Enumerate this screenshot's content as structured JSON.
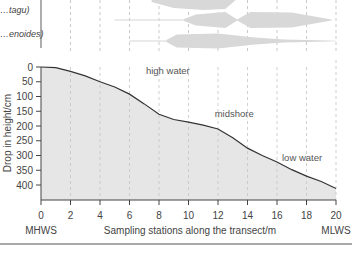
{
  "chart_data": {
    "type": "area",
    "title": "",
    "xlabel": "Sampling stations along the transect/m",
    "ylabel": "Drop in height/cm",
    "xlim": [
      0,
      20
    ],
    "ylim": [
      0,
      450
    ],
    "y_inverted": true,
    "x_ticks": [
      0,
      2,
      4,
      6,
      8,
      10,
      12,
      14,
      16,
      18,
      20
    ],
    "y_ticks": [
      0,
      50,
      100,
      150,
      200,
      250,
      300,
      350,
      400
    ],
    "x_end_labels": {
      "left": "MHWS",
      "right": "MLWS"
    },
    "grid": "vertical dashed",
    "profile": {
      "x": [
        0,
        1,
        2,
        3,
        4,
        5,
        6,
        7,
        8,
        9,
        10,
        11,
        12,
        13,
        14,
        15,
        16,
        17,
        18,
        19,
        20
      ],
      "y": [
        0,
        2,
        15,
        30,
        50,
        68,
        92,
        125,
        160,
        178,
        187,
        197,
        210,
        240,
        275,
        300,
        322,
        348,
        370,
        388,
        412
      ]
    },
    "annotations": [
      {
        "text": "high water",
        "x": 8.6,
        "y": 25
      },
      {
        "text": "midshore",
        "x": 13.1,
        "y": 170
      },
      {
        "text": "low water",
        "x": 17.7,
        "y": 320
      }
    ],
    "kite_rows": [
      {
        "label": "",
        "line_from": 7.5,
        "profile": [
          [
            7.5,
            0.2
          ],
          [
            9,
            0.8
          ],
          [
            11,
            1.0
          ],
          [
            12.5,
            0.9
          ],
          [
            13.2,
            0
          ]
        ]
      },
      {
        "label": "…tagu)",
        "line_from": 5,
        "profile": [
          [
            9.7,
            0.1
          ],
          [
            10.5,
            0.55
          ],
          [
            12.5,
            0.8
          ],
          [
            13.3,
            0.05
          ],
          [
            14.2,
            0.8
          ],
          [
            17,
            0.75
          ],
          [
            19.7,
            0.05
          ]
        ]
      },
      {
        "label": "…enoides)",
        "line_from": 6,
        "profile": [
          [
            8.5,
            0.1
          ],
          [
            9.2,
            0.65
          ],
          [
            12,
            0.75
          ],
          [
            14.5,
            0.35
          ],
          [
            16.5,
            0.15
          ],
          [
            19.5,
            0.05
          ],
          [
            20,
            0.03
          ]
        ]
      }
    ]
  }
}
